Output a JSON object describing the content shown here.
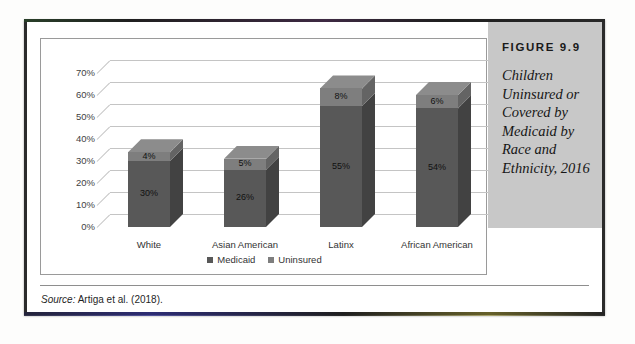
{
  "figure": {
    "number": "FIGURE 9.9",
    "caption": "Children Uninsured or Covered by Medicaid by Race and Ethnicity, 2016",
    "source_label": "Source:",
    "source_text": " Artiga et al. (2018)."
  },
  "chart_data": {
    "type": "bar",
    "subtype": "stacked-column-3d",
    "title": "Children Uninsured or Covered by Medicaid by Race and Ethnicity, 2016",
    "xlabel": "",
    "ylabel": "",
    "categories": [
      "White",
      "Asian American",
      "Latinx",
      "African American"
    ],
    "series": [
      {
        "name": "Medicaid",
        "color": "#585858",
        "values": [
          30,
          26,
          55,
          54
        ]
      },
      {
        "name": "Uninsured",
        "color": "#7e7e7e",
        "values": [
          4,
          5,
          8,
          6
        ]
      }
    ],
    "value_labels": {
      "Medicaid": [
        "30%",
        "26%",
        "55%",
        "54%"
      ],
      "Uninsured": [
        "4%",
        "5%",
        "8%",
        "6%"
      ]
    },
    "ylim": [
      0,
      70
    ],
    "ytick_values": [
      0,
      10,
      20,
      30,
      40,
      50,
      60,
      70
    ],
    "ytick_labels": [
      "0%",
      "10%",
      "20%",
      "30%",
      "40%",
      "50%",
      "60%",
      "70%"
    ],
    "grid": true,
    "legend_position": "bottom",
    "legend": [
      "Medicaid",
      "Uninsured"
    ]
  }
}
